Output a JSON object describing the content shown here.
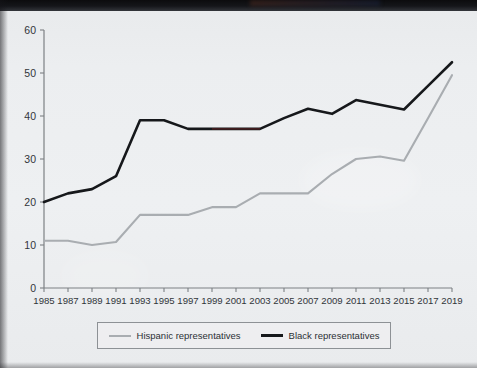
{
  "chart_data": {
    "type": "line",
    "title": "",
    "subtitle": "",
    "xlabel": "",
    "ylabel": "",
    "x": [
      1985,
      1987,
      1989,
      1991,
      1993,
      1995,
      1997,
      1999,
      2001,
      2003,
      2005,
      2007,
      2009,
      2011,
      2013,
      2015,
      2017,
      2019
    ],
    "xtick_labels": [
      "1985",
      "1987",
      "1989",
      "1991",
      "1993",
      "1995",
      "1997",
      "1999",
      "2001",
      "2003",
      "2005",
      "2007",
      "2009",
      "2011",
      "2013",
      "2015",
      "2017",
      "2019"
    ],
    "ytick_labels": [
      "0",
      "10",
      "20",
      "30",
      "40",
      "50",
      "60"
    ],
    "yticks": [
      0,
      10,
      20,
      30,
      40,
      50,
      60
    ],
    "ylim": [
      0,
      60
    ],
    "xlim": [
      1985,
      2019
    ],
    "grid": false,
    "legend_position": "bottom",
    "series": [
      {
        "name": "Hispanic representatives",
        "color": "#a9adb1",
        "width": 2.1,
        "values": [
          11,
          11,
          10,
          10.7,
          17,
          17,
          17,
          18.8,
          18.8,
          22,
          22,
          22,
          26.5,
          30,
          30.6,
          29.6,
          39.5,
          49.5
        ]
      },
      {
        "name": "Black representatives",
        "color": "#16181b",
        "width": 2.6,
        "values": [
          20,
          22,
          23,
          26,
          39,
          39,
          37,
          37,
          37,
          37,
          39.5,
          41.7,
          40.5,
          43.7,
          42.6,
          41.5,
          47,
          52.5
        ]
      }
    ]
  },
  "legend": {
    "entries": [
      {
        "label": "Hispanic representatives",
        "swatch": "line-swatch-gray"
      },
      {
        "label": "Black representatives",
        "swatch": "line-swatch-black"
      }
    ]
  },
  "colors": {
    "background": "#eceef0",
    "axis": "#7c8084",
    "black_series": "#16181b",
    "gray_series": "#a9adb1",
    "text": "#31353a"
  }
}
